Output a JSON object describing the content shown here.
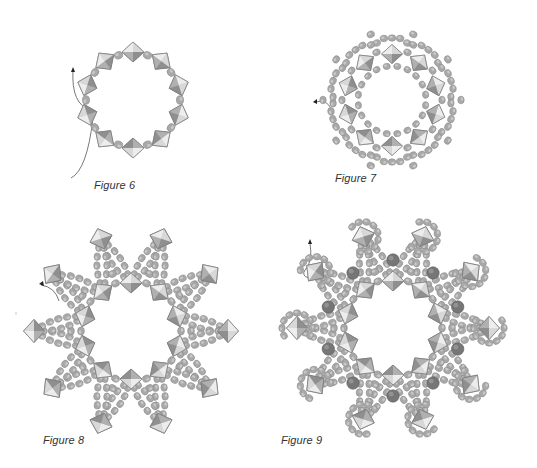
{
  "colors": {
    "bicone_light": "#ededed",
    "bicone_mid": "#c4c4c4",
    "bicone_dark": "#8f8f8f",
    "bicone_edge": "#7d7d7d",
    "seed": "#a9a9a9",
    "seed_edge": "#8a8a8a",
    "seed_highlight": "#cfcfcf",
    "pearl": "#767676",
    "pearl_highlight": "#9a9a9a",
    "thread": "#555555"
  },
  "figures": [
    {
      "id": "figure-6",
      "label": "Figure 6",
      "label_pos": [
        94,
        179
      ],
      "center": [
        133,
        100
      ],
      "type": "ring-basic",
      "inner_bicones": 10,
      "inner_radius": 48
    },
    {
      "id": "figure-7",
      "label": "Figure 7",
      "label_pos": [
        335,
        172
      ],
      "center": [
        392,
        100
      ],
      "type": "ring-embellished",
      "inner_bicones": 10,
      "inner_radius": 46
    },
    {
      "id": "figure-8",
      "label": "Figure 8",
      "label_pos": [
        43,
        434
      ],
      "center": [
        131,
        331
      ],
      "type": "star",
      "inner_bicones": 10,
      "inner_radius": 48,
      "outer_bicones": 10,
      "outer_radius": 97
    },
    {
      "id": "figure-9",
      "label": "Figure 9",
      "label_pos": [
        281,
        434
      ],
      "center": [
        393,
        328
      ],
      "type": "star-embellished",
      "inner_bicones": 10,
      "inner_radius": 47,
      "outer_bicones": 10,
      "outer_radius": 96,
      "pearl_radius": 68
    }
  ]
}
